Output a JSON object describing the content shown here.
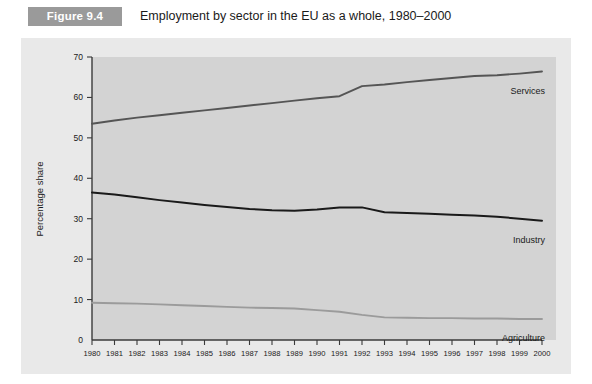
{
  "header": {
    "figure_number": "Figure 9.4",
    "caption": "Employment by sector in the EU as a whole, 1980–2000"
  },
  "colors": {
    "badge_bg": "#9a9a9a",
    "panel_bg": "#e9e9e9",
    "plot_bg": "#d3d3d3",
    "axis": "#3a3a3a",
    "services": "#555555",
    "industry": "#1a1a1a",
    "agriculture": "#9b9b9b"
  },
  "chart_data": {
    "type": "line",
    "title": "Employment by sector in the EU as a whole, 1980–2000",
    "xlabel": "",
    "ylabel": "Percentage share",
    "xlim": [
      1980,
      2000
    ],
    "ylim": [
      0,
      70
    ],
    "ytick_step": 10,
    "grid": false,
    "legend_position": "inline-right",
    "categories": [
      "1980",
      "1981",
      "1982",
      "1983",
      "1984",
      "1985",
      "1986",
      "1987",
      "1988",
      "1989",
      "1990",
      "1991",
      "1992",
      "1993",
      "1994",
      "1995",
      "1996",
      "1997",
      "1998",
      "1999",
      "2000"
    ],
    "yticks": [
      "0",
      "10",
      "20",
      "30",
      "40",
      "50",
      "60",
      "70"
    ],
    "series": [
      {
        "name": "Services",
        "color": "#555555",
        "width": 1.9,
        "label_x": 2000,
        "values": [
          53.5,
          54.3,
          55.0,
          55.6,
          56.2,
          56.8,
          57.4,
          58.0,
          58.6,
          59.2,
          59.8,
          60.3,
          62.8,
          63.2,
          63.8,
          64.3,
          64.8,
          65.3,
          65.5,
          65.9,
          66.4
        ]
      },
      {
        "name": "Industry",
        "color": "#1a1a1a",
        "width": 2.0,
        "label_x": 2000,
        "values": [
          36.5,
          36.0,
          35.3,
          34.6,
          34.0,
          33.4,
          32.9,
          32.4,
          32.1,
          32.0,
          32.3,
          32.8,
          32.8,
          31.6,
          31.4,
          31.2,
          31.0,
          30.8,
          30.5,
          30.0,
          29.5
        ]
      },
      {
        "name": "Agriculture",
        "color": "#9b9b9b",
        "width": 1.9,
        "label_x": 2000,
        "values": [
          9.2,
          9.1,
          9.0,
          8.8,
          8.6,
          8.4,
          8.2,
          8.0,
          7.9,
          7.8,
          7.4,
          7.0,
          6.2,
          5.6,
          5.5,
          5.4,
          5.4,
          5.3,
          5.3,
          5.2,
          5.2
        ]
      }
    ]
  }
}
